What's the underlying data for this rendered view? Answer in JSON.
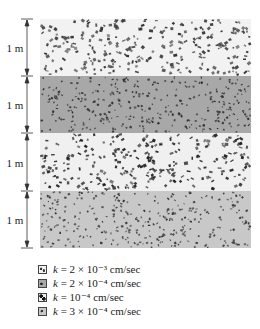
{
  "figure": {
    "type": "layered soil profile",
    "layers": [
      {
        "thickness_label": "1 m",
        "k_label": "k = 2 × 10⁻³ cm/sec",
        "fill": "#f2f2f2",
        "dot_color": "#333333",
        "dot_density": "high"
      },
      {
        "thickness_label": "1 m",
        "k_label": "k = 2 × 10⁻⁴ cm/sec",
        "fill": "#a8a8a8",
        "dot_color": "#2a2a2a",
        "dot_density": "medium"
      },
      {
        "thickness_label": "1 m",
        "k_label": "k = 10⁻⁴ cm/sec",
        "fill": "#f0f0f0",
        "dot_color": "#222222",
        "dot_density": "high"
      },
      {
        "thickness_label": "1 m",
        "k_label": "k = 3 × 10⁻⁴ cm/sec",
        "fill": "#c8c8c8",
        "dot_color": "#333333",
        "dot_density": "medium"
      }
    ],
    "legend": [
      {
        "prefix": "k",
        "text": " = 2 × 10⁻³ cm/sec"
      },
      {
        "prefix": "k",
        "text": " = 2 × 10⁻⁴ cm/sec"
      },
      {
        "prefix": "k",
        "text": " = 10⁻⁴ cm/sec"
      },
      {
        "prefix": "k",
        "text": " = 3 × 10⁻⁴ cm/sec"
      }
    ]
  }
}
